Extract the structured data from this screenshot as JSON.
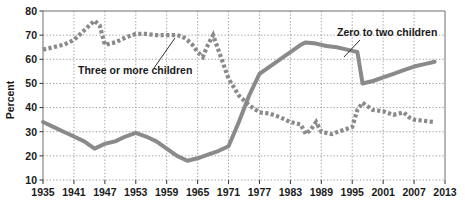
{
  "chart_data": {
    "type": "line",
    "title": "",
    "subtitle": "",
    "xlabel": "",
    "ylabel": "Percent",
    "xlim": [
      1935,
      2013
    ],
    "ylim": [
      10,
      80
    ],
    "ytick_step": 10,
    "xtick_step": 6,
    "grid": true,
    "grid_style": "dotted",
    "legend_position": "inline-annotations",
    "yticks": [
      "80",
      "70",
      "60",
      "50",
      "40",
      "30",
      "20",
      "10"
    ],
    "xticks": [
      "1935",
      "1941",
      "1947",
      "1953",
      "1959",
      "1965",
      "1971",
      "1977",
      "1983",
      "1989",
      "1995",
      "2001",
      "2007",
      "2013"
    ],
    "series": [
      {
        "name": "Zero to two children",
        "style": "solid",
        "color": "#8a8a8a",
        "x": [
          1935,
          1937,
          1939,
          1941,
          1943,
          1945,
          1947,
          1949,
          1951,
          1953,
          1955,
          1957,
          1959,
          1961,
          1963,
          1965,
          1967,
          1969,
          1971,
          1973,
          1975,
          1977,
          1979,
          1981,
          1983,
          1985,
          1986,
          1988,
          1990,
          1992,
          1994,
          1995,
          1996,
          1997,
          1999,
          2001,
          2003,
          2005,
          2007,
          2009,
          2011
        ],
        "values": [
          34,
          32,
          30,
          28,
          26,
          23,
          25,
          26,
          28,
          29.5,
          28,
          26,
          23,
          20,
          18,
          19,
          20.5,
          22,
          24,
          34,
          45,
          54,
          57,
          60,
          63,
          66,
          67,
          66.5,
          65.5,
          65,
          64,
          63.5,
          63,
          50,
          51,
          52.5,
          54,
          55.5,
          57,
          58,
          59
        ]
      },
      {
        "name": "Three or more children",
        "style": "dotted",
        "color": "#8a8a8a",
        "x": [
          1935,
          1937,
          1939,
          1941,
          1943,
          1945,
          1946,
          1947,
          1949,
          1951,
          1953,
          1955,
          1957,
          1959,
          1961,
          1962,
          1963,
          1964,
          1965,
          1966,
          1967,
          1968,
          1969,
          1971,
          1973,
          1975,
          1977,
          1979,
          1981,
          1983,
          1985,
          1986,
          1987,
          1988,
          1989,
          1991,
          1993,
          1995,
          1996,
          1997,
          1998,
          1999,
          2001,
          2003,
          2005,
          2006,
          2007,
          2009,
          2011
        ],
        "values": [
          64,
          65,
          66,
          68,
          72,
          76,
          74,
          66,
          67,
          69,
          70.5,
          70.5,
          70,
          70,
          70,
          69.5,
          68,
          66,
          63,
          61,
          66,
          70,
          64,
          52,
          45,
          41,
          38,
          37.5,
          36,
          34,
          33,
          29,
          31,
          34,
          30,
          29,
          30.5,
          32,
          39,
          42,
          40.5,
          39,
          38.5,
          37,
          38,
          36,
          35,
          34.5,
          34
        ]
      }
    ],
    "annotations": [
      {
        "text": "Three or more children",
        "label_x": 78,
        "label_y": 74,
        "leader_from_x": 154,
        "leader_from_y": 68,
        "leader_to_x": 175,
        "leader_to_y": 38
      },
      {
        "text": "Zero to two children",
        "label_x": 337,
        "label_y": 36,
        "leader_from_x": 360,
        "leader_from_y": 40,
        "leader_to_x": 344,
        "leader_to_y": 57
      }
    ]
  },
  "axis": {
    "y_title": "Percent"
  }
}
